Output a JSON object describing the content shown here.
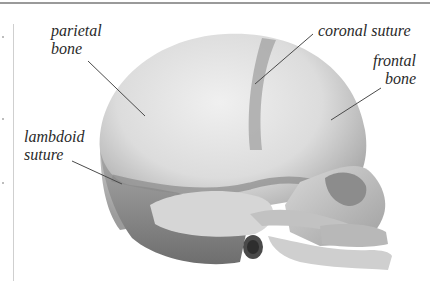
{
  "figure": {
    "labels": [
      {
        "id": "parietal",
        "line1": "parietal",
        "line2": "bone"
      },
      {
        "id": "coronal",
        "line1": "coronal suture"
      },
      {
        "id": "frontal",
        "line1": "frontal",
        "line2": "bone"
      },
      {
        "id": "lambdoid",
        "line1": "lambdoid",
        "line2": "suture"
      }
    ]
  },
  "colors": {
    "label_text": "#2a2a2a",
    "leader_line": "#4a4a4a",
    "bone_light": "#e6e6e6",
    "bone_mid": "#bdbdbd",
    "bone_dark": "#7a7a7a"
  }
}
